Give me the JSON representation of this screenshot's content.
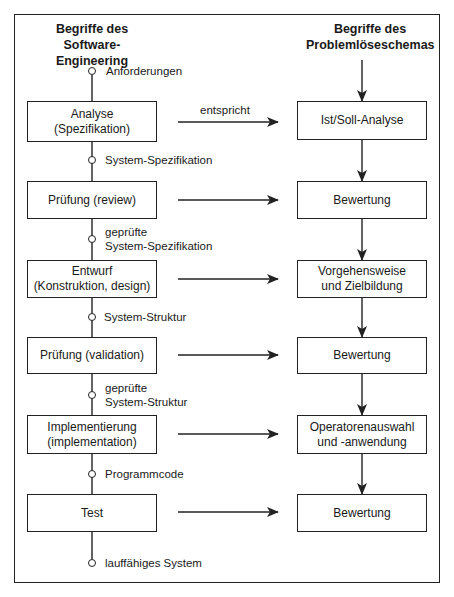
{
  "headers": {
    "left": {
      "line1": "Begriffe des",
      "line2": "Software-Engineering"
    },
    "right": {
      "line1": "Begriffe des",
      "line2": "Problemlöseschemas"
    }
  },
  "left_boxes": [
    {
      "line1": "Analyse",
      "line2": "(Spezifikation)"
    },
    {
      "line1": "Prüfung (review)",
      "line2": ""
    },
    {
      "line1": "Entwurf",
      "line2": "(Konstruktion, design)"
    },
    {
      "line1": "Prüfung (validation)",
      "line2": ""
    },
    {
      "line1": "Implementierung",
      "line2": "(implementation)"
    },
    {
      "line1": "Test",
      "line2": ""
    }
  ],
  "right_boxes": [
    {
      "line1": "Ist/Soll-Analyse",
      "line2": ""
    },
    {
      "line1": "Bewertung",
      "line2": ""
    },
    {
      "line1": "Vorgehensweise",
      "line2": "und Zielbildung"
    },
    {
      "line1": "Bewertung",
      "line2": ""
    },
    {
      "line1": "Operatorenauswahl",
      "line2": "und -anwendung"
    },
    {
      "line1": "Bewertung",
      "line2": ""
    }
  ],
  "artifacts": [
    {
      "line1": "Anforderungen",
      "line2": ""
    },
    {
      "line1": "System-Spezifikation",
      "line2": ""
    },
    {
      "line1": "geprüfte",
      "line2": "System-Spezifikation"
    },
    {
      "line1": "System-Struktur",
      "line2": ""
    },
    {
      "line1": "geprüfte",
      "line2": "System-Struktur"
    },
    {
      "line1": "Programmcode",
      "line2": ""
    },
    {
      "line1": "lauffähiges System",
      "line2": ""
    }
  ],
  "relation_label": "entspricht",
  "colors": {
    "stroke": "#222222",
    "background": "#ffffff",
    "text": "#1a1a1a"
  }
}
